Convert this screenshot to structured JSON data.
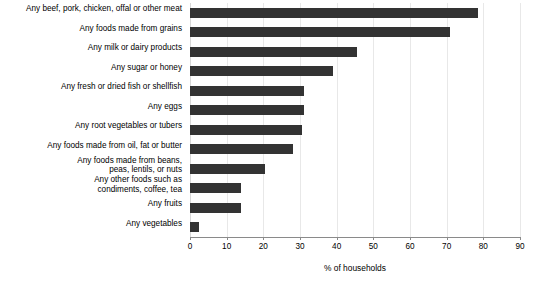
{
  "chart_data": {
    "type": "bar",
    "orientation": "horizontal",
    "title": "",
    "subtitle": "",
    "xlabel": "% of households",
    "ylabel": "",
    "xlim": [
      0,
      90
    ],
    "xticks": [
      0,
      10,
      20,
      30,
      40,
      50,
      60,
      70,
      80,
      90
    ],
    "xtick_labels": [
      "0",
      "10",
      "20",
      "30",
      "40",
      "50",
      "60",
      "70",
      "80",
      "90"
    ],
    "grid": "vertical",
    "legend": null,
    "bar_color": "#333333",
    "categories": [
      "Any beef, pork, chicken, offal or other meat",
      "Any foods made from grains",
      "Any milk or dairy products",
      "Any sugar or honey",
      "Any fresh or dried fish or shellfish",
      "Any eggs",
      "Any root vegetables or tubers",
      "Any foods made from oil, fat or butter",
      "Any foods made from beans,\npeas, lentils, or nuts",
      "Any other foods such as\ncondiments, coffee, tea",
      "Any fruits",
      "Any vegetables"
    ],
    "values": [
      78.5,
      71,
      45.5,
      39,
      31,
      31,
      30.5,
      28,
      20.5,
      14,
      14,
      2.5
    ]
  },
  "axis": {
    "x_title": "% of households"
  }
}
